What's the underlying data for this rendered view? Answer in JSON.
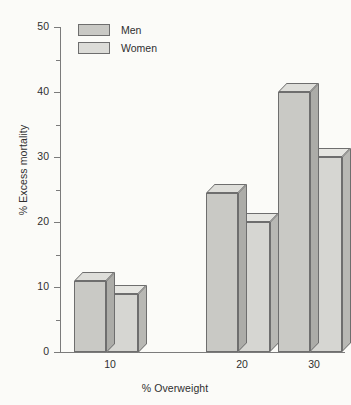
{
  "chart_data": {
    "type": "bar",
    "title": "",
    "subtitle": "",
    "xlabel": "% Overweight",
    "ylabel": "% Excess mortality",
    "categories": [
      "10",
      "20",
      "30"
    ],
    "series": [
      {
        "name": "Men",
        "values": [
          11,
          24.5,
          40
        ]
      },
      {
        "name": "Women",
        "values": [
          9,
          20,
          30
        ]
      }
    ],
    "ylim": [
      0,
      50
    ],
    "y_major_ticks": [
      0,
      10,
      20,
      30,
      40,
      50
    ],
    "y_minor_ticks": [
      5,
      15,
      25,
      35,
      45
    ],
    "y_tick_labels": [
      "0",
      "10",
      "20",
      "30",
      "40",
      "50"
    ],
    "grid": false,
    "legend_position": "top-left",
    "style": "3d-bars",
    "colors": {
      "men_face": "#c9c9c5",
      "men_top": "#dededa",
      "men_side": "#acaca8",
      "women_face": "#d6d6d2",
      "women_top": "#e6e6e2",
      "women_side": "#b8b8b4",
      "axis": "#7b7b7b",
      "outline": "#6e6e6e",
      "background": "#fbfbf8",
      "text": "#2f2f2f"
    }
  },
  "legend": {
    "items": [
      {
        "label": "Men"
      },
      {
        "label": "Women"
      }
    ]
  },
  "axes": {
    "y": {
      "title": "% Excess mortality",
      "labels": [
        "50",
        "40",
        "30",
        "20",
        "10",
        "0"
      ]
    },
    "x": {
      "title": "% Overweight",
      "labels": [
        "10",
        "20",
        "30"
      ]
    }
  }
}
